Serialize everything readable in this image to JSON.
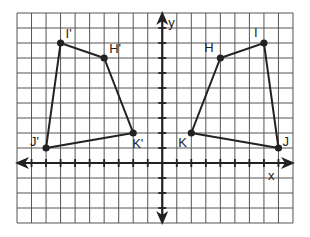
{
  "figure": {
    "type": "coordinate-plane",
    "axes": {
      "x_label": "x",
      "y_label": "y",
      "x_range": [
        -10,
        9
      ],
      "y_range": [
        -4,
        10
      ]
    },
    "grid": {
      "left": 17,
      "top": 13,
      "cols": 19,
      "rows": 14,
      "cell_w": 14.526,
      "cell_h": 15,
      "origin_col": 10,
      "origin_row": 10
    },
    "colors": {
      "grid": "#555555",
      "axis": "#222222",
      "shape": "#222222"
    },
    "original_figure": {
      "name": "HIJK",
      "points": [
        {
          "label": "H",
          "x": 4,
          "y": 7,
          "label_dx": -16,
          "label_dy": -6
        },
        {
          "label": "I",
          "x": 7,
          "y": 8,
          "label_dx": -10,
          "label_dy": -6
        },
        {
          "label": "J",
          "x": 8,
          "y": 1,
          "label_dx": 4,
          "label_dy": -2
        },
        {
          "label": "K",
          "x": 2,
          "y": 2,
          "label_dx": -13,
          "label_dy": 14
        }
      ]
    },
    "image_figure": {
      "name": "H'I'J'K'",
      "points": [
        {
          "label": "H'",
          "x": -4,
          "y": 7,
          "label_dx": 5,
          "label_dy": -5
        },
        {
          "label": "I'",
          "x": -7,
          "y": 8,
          "label_dx": 5,
          "label_dy": -5
        },
        {
          "label": "J'",
          "x": -8,
          "y": 1,
          "label_dx": -16,
          "label_dy": -2
        },
        {
          "label": "K'",
          "x": -2,
          "y": 2,
          "label_dx": -1,
          "label_dy": 15
        }
      ]
    }
  }
}
